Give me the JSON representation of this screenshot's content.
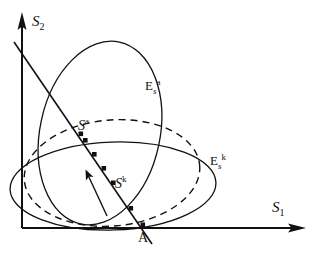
{
  "figure": {
    "background_color": "#ffffff",
    "ink_color": "#111111",
    "width": 315,
    "height": 253
  },
  "axes": {
    "horizontal": {
      "label": "S",
      "subscript": "1",
      "name": "s1-axis"
    },
    "vertical": {
      "label": "S",
      "subscript": "2",
      "name": "s2-axis"
    },
    "origin_label": ""
  },
  "curves": [
    {
      "name": "tall-ellipse-Esa",
      "style": "solid",
      "label": "E",
      "label_sub": "s",
      "label_sup": "a"
    },
    {
      "name": "dashed-flat-ellipse",
      "style": "dashed",
      "label": "",
      "label_sub": "",
      "label_sup": ""
    },
    {
      "name": "flat-ellipse-Esk",
      "style": "solid",
      "label": "E",
      "label_sub": "s",
      "label_sup": "k"
    }
  ],
  "points": [
    {
      "name": "point-Sa",
      "label": "S",
      "superscript": "a"
    },
    {
      "name": "point-Sk",
      "label": "S",
      "superscript": "k"
    },
    {
      "name": "point-A",
      "label": "A",
      "superscript": ""
    }
  ],
  "annotations": {
    "ray_name": "trajectory-ray",
    "direction_arrow_name": "direction-arrow",
    "marker_dot_count": 6
  }
}
